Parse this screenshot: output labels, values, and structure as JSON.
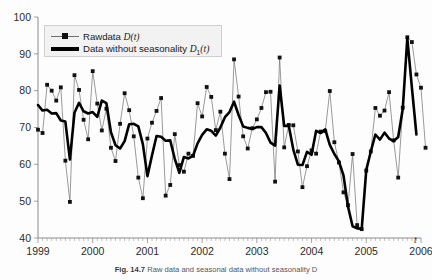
{
  "figure": {
    "caption_label": "Fig. 14.7",
    "caption_text": "Raw data and seasonal data without seasonality D",
    "axis_x_name": "t"
  },
  "legend": {
    "position": "top-left-inside",
    "items": [
      {
        "label_prefix": "Rawdata ",
        "symbol": "D",
        "subscript": "",
        "suffix": "(t)",
        "style": "thin-line-with-square-markers",
        "color": "#6e6e6e"
      },
      {
        "label_prefix": "Data without seasonality ",
        "symbol": "D",
        "subscript": "1",
        "suffix": "(t)",
        "style": "thick-solid-line",
        "color": "#000000"
      }
    ]
  },
  "chart_data": {
    "type": "line",
    "title": "",
    "subtitle": "",
    "xlabel": "t",
    "ylabel": "",
    "ylim": [
      40,
      100
    ],
    "xlim": [
      1999.0,
      2006.0
    ],
    "yticks": [
      40,
      50,
      60,
      70,
      80,
      90,
      100
    ],
    "xticks": [
      1999,
      2000,
      2001,
      2002,
      2003,
      2004,
      2005,
      2006
    ],
    "xtick_labels": [
      "1999",
      "2000",
      "2001",
      "2002",
      "2003",
      "2004",
      "2005",
      "2006"
    ],
    "ytick_labels": [
      "40",
      "50",
      "60",
      "70",
      "80",
      "90",
      "100"
    ],
    "grid": false,
    "minor_ticks_x": "monthly",
    "legend_position": "upper left",
    "x_start": 1999.0,
    "x_step": 0.08333,
    "series": [
      {
        "name": "Rawdata D(t)",
        "style": "thin-line-with-square-markers",
        "color": "#6e6e6e",
        "marker_color": "#111111",
        "values": [
          69.4,
          68.5,
          81.6,
          80.0,
          77.3,
          80.9,
          61.0,
          49.8,
          84.2,
          80.2,
          72.1,
          66.8,
          85.3,
          76.5,
          69.2,
          75.1,
          64.5,
          60.9,
          71.0,
          79.3,
          74.7,
          67.6,
          56.4,
          50.8,
          67.0,
          71.3,
          74.5,
          78.0,
          51.5,
          54.4,
          68.2,
          59.8,
          58.0,
          62.9,
          62.3,
          76.6,
          73.0,
          81.0,
          78.3,
          69.3,
          74.3,
          62.9,
          56.0,
          88.5,
          78.4,
          67.6,
          64.3,
          69.8,
          72.2,
          75.3,
          79.6,
          79.7,
          55.3,
          89.0,
          64.6,
          70.7,
          70.6,
          63.5,
          53.8,
          59.5,
          63.8,
          62.9,
          68.9,
          69.0,
          79.9,
          66.0,
          60.5,
          52.4,
          48.9,
          62.8,
          43.5,
          42.4,
          58.3,
          63.5,
          75.3,
          73.2,
          74.6,
          79.6,
          66.5,
          56.4,
          75.4,
          94.5,
          93.2,
          84.4,
          80.8,
          64.5
        ]
      },
      {
        "name": "Data without seasonality D1(t)",
        "style": "thick-solid-line",
        "color": "#000000",
        "values": [
          76.1,
          74.6,
          74.8,
          73.8,
          73.9,
          71.9,
          71.6,
          61.3,
          74.0,
          76.7,
          74.4,
          73.8,
          74.2,
          72.9,
          77.3,
          76.6,
          68.7,
          65.2,
          64.3,
          66.3,
          70.9,
          71.0,
          70.3,
          65.5,
          56.8,
          62.4,
          67.7,
          67.5,
          66.4,
          66.5,
          61.5,
          57.7,
          62.0,
          61.6,
          62.3,
          65.7,
          68.0,
          69.5,
          69.1,
          67.8,
          70.0,
          72.8,
          74.2,
          77.0,
          73.4,
          70.3,
          69.9,
          69.6,
          70.1,
          70.1,
          68.5,
          65.9,
          65.1,
          81.4,
          70.4,
          70.5,
          64.0,
          59.9,
          59.8,
          63.4,
          62.6,
          69.1,
          68.5,
          69.5,
          65.3,
          62.8,
          60.8,
          57.0,
          48.5,
          43.2,
          42.6,
          42.5,
          58.5,
          63.5,
          68.1,
          66.7,
          68.6,
          67.0,
          66.3,
          67.4,
          75.0,
          94.3,
          80.9,
          68.1
        ]
      }
    ]
  }
}
